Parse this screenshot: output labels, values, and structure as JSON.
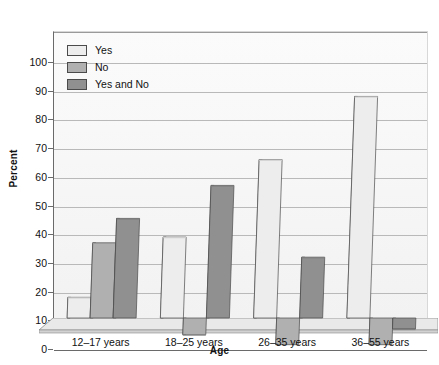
{
  "chart_data": {
    "type": "bar",
    "title": "",
    "xlabel": "Age",
    "ylabel": "Percent",
    "ylim": [
      0,
      100
    ],
    "ytick_step": 10,
    "yticks": [
      0,
      10,
      20,
      30,
      40,
      50,
      60,
      70,
      80,
      90,
      100
    ],
    "grid": "horizontal",
    "legend_position": "inside top-left",
    "style": "3d-grouped-bars-grayscale",
    "categories": [
      "12–17 years",
      "18–25 years",
      "26–35 years",
      "36–55 years"
    ],
    "series": [
      {
        "name": "Yes",
        "color": "#ededed",
        "values": [
          18,
          39,
          66,
          88
        ]
      },
      {
        "name": "No",
        "color": "#b0b0b0",
        "values": [
          37,
          5,
          1.5,
          1.5
        ]
      },
      {
        "name": "Yes and No",
        "color": "#909090",
        "values": [
          45.5,
          57,
          32,
          7
        ]
      }
    ]
  },
  "legend": {
    "items": [
      {
        "label": "Yes",
        "swatch_color": "#ededed"
      },
      {
        "label": "No",
        "swatch_color": "#b0b0b0"
      },
      {
        "label": "Yes and No",
        "swatch_color": "#909090"
      }
    ]
  },
  "axes": {
    "y_title": "Percent",
    "x_title": "Age",
    "y_tick_labels": [
      "0",
      "10",
      "20",
      "30",
      "40",
      "50",
      "60",
      "70",
      "80",
      "90",
      "100"
    ],
    "x_tick_labels": [
      "12–17 years",
      "18–25 years",
      "26–35 years",
      "36–55 years"
    ]
  },
  "colors": {
    "axis_line": "#6a6a6a",
    "gridline": "#b9b9b9",
    "plot_background": "#f7f7f7",
    "text": "#111111",
    "bar_side_dark": "#3a3a3a",
    "bar_outline": "#4b4b4b"
  }
}
